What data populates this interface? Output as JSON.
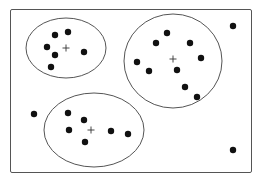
{
  "diagram": {
    "type": "cluster-scatter",
    "frame": {
      "x": 10,
      "y": 9,
      "width": 241,
      "height": 163
    },
    "colors": {
      "stroke": "#555555",
      "point": "#111111",
      "background": "#ffffff"
    },
    "clusters": [
      {
        "id": "cluster-top-left",
        "ellipse": {
          "cx": 66,
          "cy": 48,
          "rx": 40,
          "ry": 30
        },
        "centroid": {
          "x": 66,
          "y": 48
        },
        "points": [
          [
            55,
            35
          ],
          [
            68,
            32
          ],
          [
            47,
            47
          ],
          [
            55,
            55
          ],
          [
            84,
            52
          ],
          [
            51,
            67
          ]
        ]
      },
      {
        "id": "cluster-right",
        "ellipse": {
          "cx": 173,
          "cy": 61,
          "rx": 49,
          "ry": 47
        },
        "centroid": {
          "x": 173,
          "y": 59
        },
        "points": [
          [
            167,
            33
          ],
          [
            156,
            43
          ],
          [
            190,
            43
          ],
          [
            137,
            62
          ],
          [
            201,
            58
          ],
          [
            149,
            71
          ],
          [
            177,
            70
          ],
          [
            185,
            87
          ],
          [
            197,
            97
          ]
        ]
      },
      {
        "id": "cluster-bottom",
        "ellipse": {
          "cx": 94,
          "cy": 130,
          "rx": 50,
          "ry": 37
        },
        "centroid": {
          "x": 91,
          "y": 130
        },
        "points": [
          [
            68,
            113
          ],
          [
            84,
            120
          ],
          [
            69,
            130
          ],
          [
            85,
            142
          ],
          [
            111,
            131
          ],
          [
            128,
            134
          ]
        ]
      }
    ],
    "outliers": [
      [
        233,
        26
      ],
      [
        34,
        114
      ],
      [
        233,
        150
      ]
    ]
  }
}
